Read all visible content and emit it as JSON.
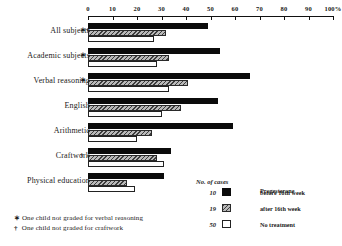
{
  "chart_data": {
    "type": "bar",
    "orientation": "horizontal",
    "title": "",
    "xlabel": "",
    "ylabel": "",
    "xlim": [
      0,
      100
    ],
    "xticks": [
      0,
      10,
      20,
      30,
      40,
      50,
      60,
      70,
      80,
      90,
      100
    ],
    "xtick_labels": [
      "0",
      "10",
      "20",
      "30",
      "40",
      "50",
      "60",
      "70",
      "80",
      "90",
      "100%"
    ],
    "grid": false,
    "legend_position": "bottom-right",
    "categories": [
      "All subjects",
      "Academic subjects",
      "Verbal reasoning",
      "English",
      "Arithmetic",
      "Craftwork",
      "Physical education"
    ],
    "category_marks": [
      "∗†",
      "∗",
      "∗",
      "",
      "",
      "†",
      ""
    ],
    "series": [
      {
        "name": "Progesterone before 16th week",
        "n": 10,
        "style": "black",
        "values": [
          49,
          54,
          66,
          53,
          59,
          34,
          31
        ]
      },
      {
        "name": "Progesterone after 16th week",
        "n": 19,
        "style": "hatched",
        "values": [
          32,
          33,
          41,
          38,
          26,
          28,
          16
        ]
      },
      {
        "name": "No treatment",
        "n": 50,
        "style": "white",
        "values": [
          27,
          28,
          33,
          30,
          20,
          31,
          19
        ]
      }
    ]
  },
  "legend": {
    "title": "No. of cases",
    "header": "Progesterone",
    "entries": [
      {
        "n": "10",
        "label": "before 16th week",
        "swatch": "black"
      },
      {
        "n": "19",
        "label": "after 16th week",
        "swatch": "hatched"
      },
      {
        "n": "50",
        "label": "No treatment",
        "swatch": "white"
      }
    ]
  },
  "footnotes": [
    {
      "symbol": "∗",
      "text": "One child not graded for verbal reasoning"
    },
    {
      "symbol": "†",
      "text": "One child not graded for craftwork"
    }
  ]
}
